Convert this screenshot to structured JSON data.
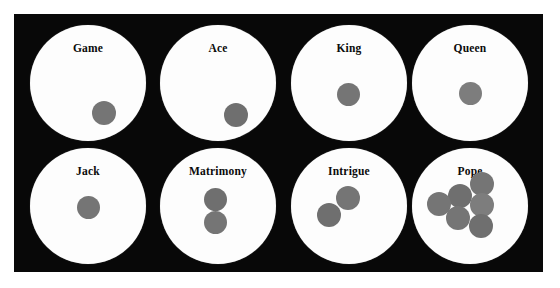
{
  "figure": {
    "kind": "pope-joan-board-diagram",
    "background_color": "#ffffff",
    "plate_color": "#080808",
    "disc_color": "#fdfdfd",
    "counter_color": "#787878",
    "label_color": "#0b0b0b",
    "rows": 2,
    "columns": 4
  },
  "compartments": [
    {
      "id": "game",
      "label": "Game",
      "row": 1,
      "column": 1,
      "counter_count": 1,
      "counters": [
        {
          "x": 62,
          "y": 76,
          "d": 24,
          "shade": "shade-a"
        }
      ]
    },
    {
      "id": "ace",
      "label": "Ace",
      "row": 1,
      "column": 2,
      "counter_count": 1,
      "counters": [
        {
          "x": 64,
          "y": 78,
          "d": 24,
          "shade": "shade-b"
        }
      ]
    },
    {
      "id": "king",
      "label": "King",
      "row": 1,
      "column": 3,
      "counter_count": 1,
      "counters": [
        {
          "x": 46,
          "y": 58,
          "d": 23,
          "shade": "shade-a"
        }
      ]
    },
    {
      "id": "queen",
      "label": "Queen",
      "row": 1,
      "column": 4,
      "counter_count": 1,
      "counters": [
        {
          "x": 47,
          "y": 57,
          "d": 23,
          "shade": "shade-c"
        }
      ]
    },
    {
      "id": "jack",
      "label": "Jack",
      "row": 2,
      "column": 1,
      "counter_count": 1,
      "counters": [
        {
          "x": 47,
          "y": 48,
          "d": 23,
          "shade": "shade-a"
        }
      ]
    },
    {
      "id": "matrimony",
      "label": "Matrimony",
      "row": 2,
      "column": 2,
      "counter_count": 2,
      "counters": [
        {
          "x": 44,
          "y": 40,
          "d": 23,
          "shade": "shade-b"
        },
        {
          "x": 44,
          "y": 63,
          "d": 23,
          "shade": "shade-a"
        }
      ]
    },
    {
      "id": "intrigue",
      "label": "Intrigue",
      "row": 2,
      "column": 3,
      "counter_count": 2,
      "counters": [
        {
          "x": 45,
          "y": 38,
          "d": 24,
          "shade": "shade-a"
        },
        {
          "x": 26,
          "y": 55,
          "d": 24,
          "shade": "shade-b"
        }
      ]
    },
    {
      "id": "pope",
      "label": "Pope",
      "row": 2,
      "column": 4,
      "counter_count": 6,
      "counters": [
        {
          "x": 58,
          "y": 24,
          "d": 24,
          "shade": "shade-a"
        },
        {
          "x": 36,
          "y": 36,
          "d": 24,
          "shade": "shade-b"
        },
        {
          "x": 15,
          "y": 44,
          "d": 24,
          "shade": "shade-a"
        },
        {
          "x": 58,
          "y": 45,
          "d": 24,
          "shade": "shade-c"
        },
        {
          "x": 34,
          "y": 58,
          "d": 24,
          "shade": "shade-a"
        },
        {
          "x": 57,
          "y": 66,
          "d": 24,
          "shade": "shade-b"
        }
      ]
    }
  ]
}
